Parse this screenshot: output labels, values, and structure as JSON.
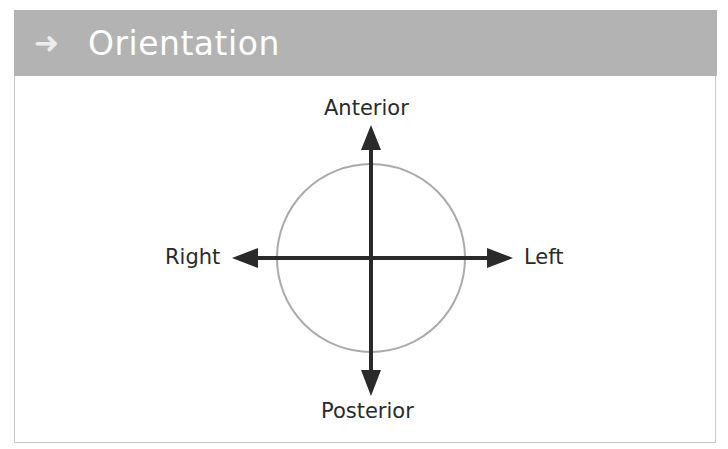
{
  "header": {
    "icon": "arrow-right-icon",
    "icon_glyph": "➜",
    "title": "Orientation"
  },
  "diagram": {
    "labels": {
      "top": "Anterior",
      "bottom": "Posterior",
      "left": "Right",
      "right": "Left"
    },
    "colors": {
      "header_bg": "#b3b3b3",
      "arrow": "#2a2a2a",
      "circle": "#aaaaaa"
    }
  }
}
